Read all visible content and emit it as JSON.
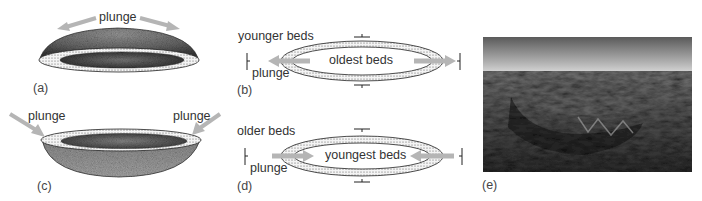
{
  "figure": {
    "panels": [
      {
        "id": "a",
        "label": "(a)",
        "type": "3d-dome",
        "annotations": [
          "plunge"
        ]
      },
      {
        "id": "b",
        "label": "(b)",
        "type": "map-view-dome",
        "annotations": {
          "outer": "younger beds",
          "center": "oldest beds",
          "arrow": "plunge"
        }
      },
      {
        "id": "c",
        "label": "(c)",
        "type": "3d-basin",
        "annotations": [
          "plunge",
          "plunge"
        ]
      },
      {
        "id": "d",
        "label": "(d)",
        "type": "map-view-basin",
        "annotations": {
          "outer": "older beds",
          "center": "youngest beds",
          "arrow": "plunge"
        }
      },
      {
        "id": "e",
        "label": "(e)",
        "type": "aerial-photograph"
      }
    ]
  },
  "labels": {
    "a_plunge": "plunge",
    "a_panel": "(a)",
    "b_outer": "younger beds",
    "b_center": "oldest beds",
    "b_plunge": "plunge",
    "b_panel": "(b)",
    "c_plunge_left": "plunge",
    "c_plunge_right": "plunge",
    "c_panel": "(c)",
    "d_outer": "older beds",
    "d_center": "youngest beds",
    "d_plunge": "plunge",
    "d_panel": "(d)",
    "e_panel": "(e)"
  },
  "colors": {
    "arrow": "#b5b5b5",
    "surface_dark": "#3a3a3a",
    "surface_mid": "#8a8a8a",
    "stipple_bg": "#f2f2f2",
    "outline": "#2a2a2a"
  }
}
